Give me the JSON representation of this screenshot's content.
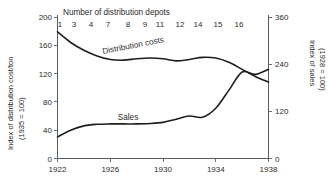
{
  "chart_data": {
    "type": "line",
    "title": "",
    "xlabel": "",
    "ylabel": "Index of distribution cost/ton",
    "grid": false,
    "legend_position": "inline-annotation",
    "x": [
      1922,
      1923,
      1924,
      1925,
      1926,
      1927,
      1928,
      1929,
      1930,
      1931,
      1932,
      1933,
      1934,
      1935,
      1936,
      1937,
      1938
    ],
    "xlim": [
      1922,
      1938
    ],
    "x_ticks": [
      "1922",
      "1926",
      "1930",
      "1934",
      "1938"
    ],
    "x_tick_values": [
      1922,
      1926,
      1930,
      1934,
      1938
    ],
    "top_axis": {
      "title": "Number of distribution depots",
      "tick_labels": [
        "1",
        "3",
        "4",
        "7",
        "8",
        "9",
        "11",
        "12",
        "14",
        "15",
        "16"
      ],
      "tick_values": [
        1922,
        1923.4,
        1924.5,
        1925.9,
        1927.2,
        1928.3,
        1929.4,
        1930.7,
        1932.0,
        1933.3,
        1934.6
      ]
    },
    "left_axis": {
      "label_line1": "Index of distribution cost/ton",
      "label_line2": "(1935 = 100)",
      "ticks": [
        0,
        40,
        80,
        120,
        160,
        200
      ],
      "tick_labels": [
        "0",
        "40",
        "80",
        "120",
        "160",
        "200"
      ],
      "ylim": [
        0,
        200
      ]
    },
    "right_axis": {
      "label_line1": "Index of sales",
      "label_line2": "(1928 = 100)",
      "ticks": [
        0,
        120,
        240,
        360
      ],
      "tick_labels": [
        "0",
        "120",
        "240",
        "360"
      ],
      "ylim": [
        0,
        360
      ]
    },
    "series": [
      {
        "name": "Distribution costs",
        "axis": "left",
        "label": "Distribution costs",
        "values": [
          179,
          164,
          153,
          145,
          140,
          139,
          141,
          142,
          141,
          138,
          140,
          143,
          142,
          136,
          126,
          116,
          108
        ]
      },
      {
        "name": "Sales",
        "axis": "right",
        "label": "Sales",
        "values": [
          55,
          72,
          83,
          87,
          88,
          88,
          88,
          89,
          92,
          100,
          108,
          105,
          128,
          174,
          220,
          214,
          227
        ]
      }
    ],
    "colors": {
      "curve": "#1e1e1e",
      "axis": "#555c5f",
      "text": "#2b2b2b",
      "background": "#ffffff"
    }
  }
}
